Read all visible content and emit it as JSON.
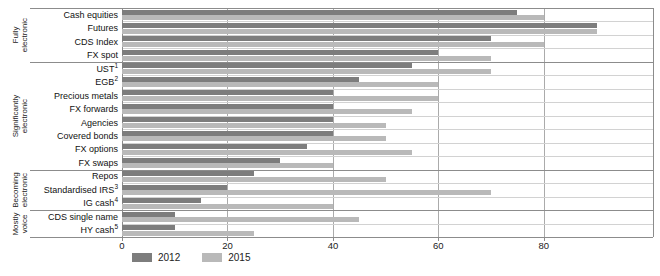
{
  "chart_data": {
    "type": "bar",
    "orientation": "horizontal",
    "title": "",
    "xlabel": "",
    "ylabel": "",
    "xlim": [
      0,
      100.7
    ],
    "x_ticks": [
      0,
      20,
      40,
      60,
      80
    ],
    "grid": "vertical-gridlines-and-row-separators",
    "legend_position": "bottom-left",
    "categories": [
      {
        "label": "Cash equities",
        "sup": ""
      },
      {
        "label": "Futures",
        "sup": ""
      },
      {
        "label": "CDS Index",
        "sup": ""
      },
      {
        "label": "FX spot",
        "sup": ""
      },
      {
        "label": "UST",
        "sup": "1"
      },
      {
        "label": "EGB",
        "sup": "2"
      },
      {
        "label": "Precious metals",
        "sup": ""
      },
      {
        "label": "FX forwards",
        "sup": ""
      },
      {
        "label": "Agencies",
        "sup": ""
      },
      {
        "label": "Covered bonds",
        "sup": ""
      },
      {
        "label": "FX options",
        "sup": ""
      },
      {
        "label": "FX swaps",
        "sup": ""
      },
      {
        "label": "Repos",
        "sup": ""
      },
      {
        "label": "Standardised IRS",
        "sup": "3"
      },
      {
        "label": "IG cash",
        "sup": "4"
      },
      {
        "label": "CDS single name",
        "sup": ""
      },
      {
        "label": "HY cash",
        "sup": "5"
      }
    ],
    "series": [
      {
        "name": "2012",
        "color": "#7d7d7d",
        "values": [
          75,
          90,
          70,
          60,
          55,
          45,
          40,
          40,
          40,
          40,
          35,
          30,
          25,
          20,
          15,
          10,
          10
        ]
      },
      {
        "name": "2015",
        "color": "#b9b9b9",
        "values": [
          80,
          90,
          80,
          70,
          70,
          60,
          60,
          55,
          50,
          50,
          55,
          40,
          50,
          70,
          40,
          45,
          25
        ]
      }
    ],
    "groups": [
      {
        "label": "Fully\nelectronic",
        "start": 0,
        "count": 4
      },
      {
        "label": "Significantly\nelectronic",
        "start": 4,
        "count": 8
      },
      {
        "label": "Becoming\nelectronic",
        "start": 12,
        "count": 3
      },
      {
        "label": "Mostly\nvoice",
        "start": 15,
        "count": 2
      }
    ]
  },
  "legend": {
    "items": [
      {
        "label": "2012",
        "color": "#7d7d7d"
      },
      {
        "label": "2015",
        "color": "#b9b9b9"
      }
    ]
  },
  "colors": {
    "background": "#ffffff",
    "gridline": "#ababab",
    "row_separator": "#d2d2d2",
    "group_separator": "#8c8c8c",
    "text": "#1a1a1a"
  }
}
